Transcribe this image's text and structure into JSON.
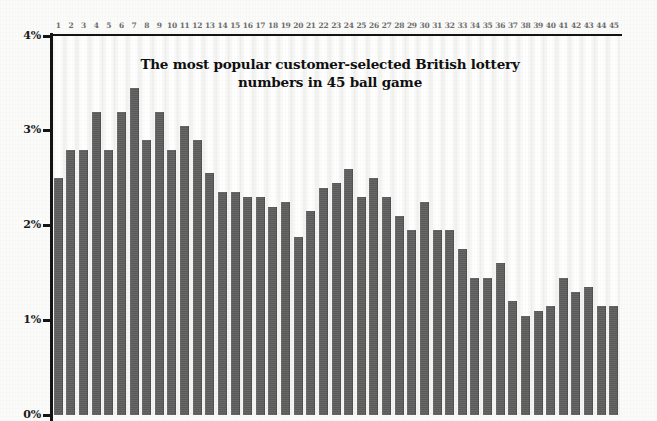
{
  "chart": {
    "title_line1": "The most popular customer-selected British lottery",
    "title_line2": "numbers in 45 ball game",
    "bar_color": "#5f5f5f",
    "axis_color": "#141414",
    "background_color": "#fbfbfa"
  },
  "chart_data": {
    "type": "bar",
    "title": "The most popular customer-selected British lottery numbers in 45 ball game",
    "xlabel": "",
    "ylabel": "",
    "ylim": [
      0,
      4
    ],
    "grid": false,
    "legend": null,
    "y_tick_labels": [
      "0%",
      "1%",
      "2%",
      "3%",
      "4%"
    ],
    "y_ticks": [
      0,
      1,
      2,
      3,
      4
    ],
    "x_axis_position": "top",
    "categories": [
      "1",
      "2",
      "3",
      "4",
      "5",
      "6",
      "7",
      "8",
      "9",
      "10",
      "11",
      "12",
      "13",
      "14",
      "15",
      "16",
      "17",
      "18",
      "19",
      "20",
      "21",
      "22",
      "23",
      "24",
      "25",
      "26",
      "27",
      "28",
      "29",
      "30",
      "31",
      "32",
      "33",
      "34",
      "35",
      "36",
      "37",
      "38",
      "39",
      "40",
      "41",
      "42",
      "43",
      "44",
      "45"
    ],
    "values": [
      2.5,
      2.8,
      2.8,
      3.2,
      2.8,
      3.2,
      3.45,
      2.9,
      3.2,
      2.8,
      3.05,
      2.9,
      2.55,
      2.35,
      2.35,
      2.3,
      2.3,
      2.2,
      2.25,
      1.88,
      2.15,
      2.4,
      2.45,
      2.6,
      2.3,
      2.5,
      2.3,
      2.1,
      1.95,
      2.25,
      1.95,
      1.95,
      1.75,
      1.45,
      1.45,
      1.6,
      1.2,
      1.05,
      1.1,
      1.15,
      1.45,
      1.3,
      1.35,
      1.15,
      1.15
    ]
  }
}
